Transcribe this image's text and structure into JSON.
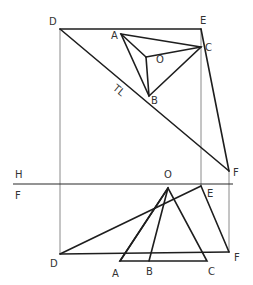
{
  "figure": {
    "type": "descriptive-geometry-projection",
    "planes": {
      "upper_label": "H",
      "lower_label": "F"
    },
    "top_view": {
      "labels": {
        "D": "D",
        "E": "E",
        "A": "A",
        "C": "C",
        "O": "O",
        "B": "B",
        "F": "F",
        "true_length": "TL"
      },
      "points": {
        "D": [
          60,
          29
        ],
        "E": [
          201,
          29
        ],
        "A": [
          121,
          34
        ],
        "C": [
          201,
          47
        ],
        "O": [
          146,
          57
        ],
        "B": [
          149,
          96
        ],
        "F": [
          229,
          171
        ]
      }
    },
    "front_view": {
      "labels": {
        "O": "O",
        "E": "E",
        "D": "D",
        "F": "F",
        "A": "A",
        "B": "B",
        "C": "C"
      },
      "points": {
        "O": [
          168,
          188
        ],
        "E": [
          201,
          186
        ],
        "D": [
          60,
          254
        ],
        "F": [
          229,
          252
        ],
        "A": [
          120,
          261
        ],
        "B": [
          149,
          261
        ],
        "C": [
          207,
          261
        ]
      }
    },
    "fold_line_y": 184,
    "colors": {
      "line": "#1e1e1e",
      "projector": "#8a8a8a",
      "label": "#333333",
      "background": "#ffffff"
    }
  }
}
